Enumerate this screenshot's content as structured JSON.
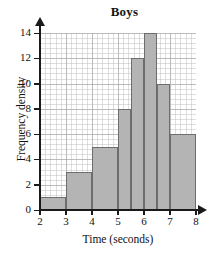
{
  "chart_data": {
    "type": "bar",
    "title": "Boys",
    "xlabel": "Time (seconds)",
    "ylabel": "Frequency density",
    "xlim": [
      2,
      8
    ],
    "ylim": [
      0,
      14
    ],
    "grid": true,
    "legend": null,
    "xticks": [
      "2",
      "3",
      "4",
      "5",
      "6",
      "7",
      "8"
    ],
    "yticks": [
      "0",
      "2",
      "4",
      "6",
      "8",
      "10",
      "12",
      "14"
    ],
    "bins": [
      {
        "label": "2-3",
        "x0": 2,
        "x1": 3,
        "value": 1
      },
      {
        "label": "3-4",
        "x0": 3,
        "x1": 4,
        "value": 3
      },
      {
        "label": "4-5",
        "x0": 4,
        "x1": 5,
        "value": 5
      },
      {
        "label": "5-5.5",
        "x0": 5,
        "x1": 5.5,
        "value": 8
      },
      {
        "label": "5.5-6",
        "x0": 5.5,
        "x1": 6,
        "value": 12
      },
      {
        "label": "6-6.5",
        "x0": 6,
        "x1": 6.5,
        "value": 14
      },
      {
        "label": "6.5-7",
        "x0": 6.5,
        "x1": 7,
        "value": 10
      },
      {
        "label": "7-8",
        "x0": 7,
        "x1": 8,
        "value": 6
      }
    ],
    "colors": {
      "bar_fill": "#b4b4b4",
      "bar_stroke": "#6d6d6d",
      "axis": "#1a1a1a",
      "grid_major": "#787878",
      "grid_minor": "#aaaaaa",
      "background": "#ffffff"
    }
  }
}
